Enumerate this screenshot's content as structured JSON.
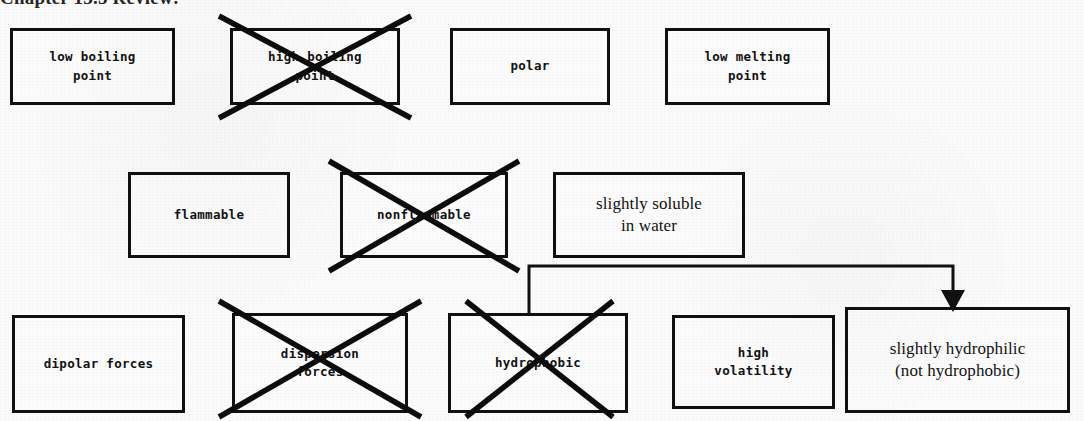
{
  "document": {
    "heading": "Chapter 13.5 Review:"
  },
  "colors": {
    "ink": "#111111",
    "paper": "#fbfbfb",
    "box_border": "#101010",
    "crossout": "#0c0c0c"
  },
  "diagram": {
    "type": "property-selection-worksheet",
    "rows": [
      {
        "row_index": 1,
        "nodes": [
          {
            "id": "low-boiling-point",
            "label": "low boiling\npoint",
            "line1": "low boiling",
            "line2": "point",
            "crossed_out": false,
            "font": "mono",
            "x": 10,
            "y": 28,
            "w": 165,
            "h": 77
          },
          {
            "id": "high-boiling-point",
            "label": "high boiling\npoint",
            "line1": "high boiling",
            "line2": "point",
            "crossed_out": true,
            "font": "mono",
            "x": 230,
            "y": 28,
            "w": 170,
            "h": 77
          },
          {
            "id": "polar",
            "label": "polar",
            "line1": "polar",
            "line2": "",
            "crossed_out": false,
            "font": "mono",
            "x": 450,
            "y": 28,
            "w": 160,
            "h": 77
          },
          {
            "id": "low-melting-point",
            "label": "low melting\npoint",
            "line1": "low melting",
            "line2": "point",
            "crossed_out": false,
            "font": "mono",
            "x": 665,
            "y": 28,
            "w": 165,
            "h": 77
          }
        ]
      },
      {
        "row_index": 2,
        "nodes": [
          {
            "id": "flammable",
            "label": "flammable",
            "line1": "flammable",
            "line2": "",
            "crossed_out": false,
            "font": "mono",
            "x": 128,
            "y": 172,
            "w": 162,
            "h": 86
          },
          {
            "id": "nonflammable",
            "label": "nonflammable",
            "line1": "nonflammable",
            "line2": "",
            "crossed_out": true,
            "font": "mono",
            "x": 340,
            "y": 172,
            "w": 168,
            "h": 86
          },
          {
            "id": "slightly-soluble-in-water",
            "label": "slightly soluble\nin water",
            "line1": "slightly soluble",
            "line2": "in water",
            "crossed_out": false,
            "font": "serif",
            "x": 553,
            "y": 172,
            "w": 192,
            "h": 86
          }
        ]
      },
      {
        "row_index": 3,
        "nodes": [
          {
            "id": "dipolar-forces",
            "label": "dipolar forces",
            "line1": "dipolar forces",
            "line2": "",
            "crossed_out": false,
            "font": "mono",
            "x": 12,
            "y": 315,
            "w": 173,
            "h": 98
          },
          {
            "id": "dispersion-forces",
            "label": "dispersion\nforces",
            "line1": "dispersion",
            "line2": "forces",
            "crossed_out": true,
            "font": "mono",
            "x": 232,
            "y": 313,
            "w": 176,
            "h": 100
          },
          {
            "id": "hydrophobic",
            "label": "hydrophobic",
            "line1": "hydrophobic",
            "line2": "",
            "crossed_out": true,
            "font": "mono",
            "x": 448,
            "y": 313,
            "w": 180,
            "h": 100
          },
          {
            "id": "high-volatility",
            "label": "high\nvolatility",
            "line1": "high",
            "line2": "volatility",
            "crossed_out": false,
            "font": "mono",
            "x": 672,
            "y": 315,
            "w": 163,
            "h": 94
          },
          {
            "id": "slightly-hydrophilic",
            "label": "slightly hydrophilic\n(not hydrophobic)",
            "line1": "slightly hydrophilic",
            "line2": "(not hydrophobic)",
            "crossed_out": false,
            "font": "serif",
            "x": 845,
            "y": 307,
            "w": 225,
            "h": 106
          }
        ]
      }
    ],
    "connector": {
      "id": "hydrophobic-to-slightly-hydrophilic",
      "from": "hydrophobic",
      "to": "slightly-hydrophilic",
      "has_arrowhead": true,
      "arrow_direction": "down"
    }
  }
}
